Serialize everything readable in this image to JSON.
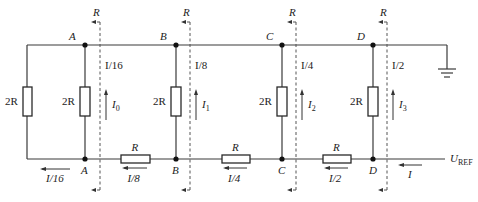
{
  "diagram": {
    "type": "R-2R ladder network (D/A converter)",
    "nodes": [
      "A",
      "B",
      "C",
      "D"
    ],
    "ladder_resistor": "R",
    "branch_resistor": "2R",
    "terminating_resistor": "2R",
    "equivalent_resistance_label": "R",
    "top_currents": [
      "I/16",
      "I/8",
      "I/4",
      "I/2"
    ],
    "branch_currents": [
      {
        "base": "I",
        "sub": "0"
      },
      {
        "base": "I",
        "sub": "1"
      },
      {
        "base": "I",
        "sub": "2"
      },
      {
        "base": "I",
        "sub": "3"
      }
    ],
    "bottom_currents": [
      "I/16",
      "I/8",
      "I/4",
      "I/2"
    ],
    "input_current": "I",
    "reference": {
      "base": "U",
      "sub": "REF"
    },
    "ground": "ground-symbol"
  }
}
